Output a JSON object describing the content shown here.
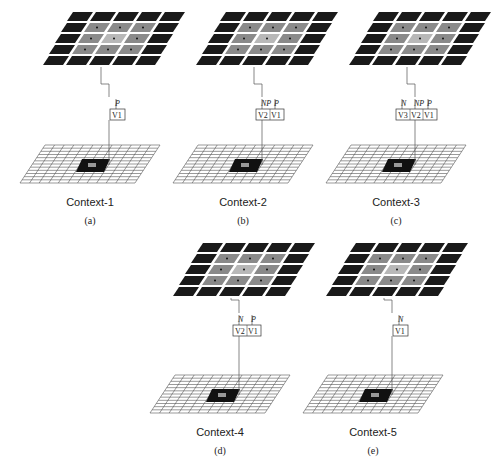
{
  "figure": {
    "panels": [
      {
        "id": "a",
        "context_label": "Context-1",
        "sub_label": "(a)",
        "units": [
          "V1"
        ],
        "unit_inputs": [
          "P"
        ],
        "ox": 55,
        "oy": 12,
        "bx": 20,
        "by": 145
      },
      {
        "id": "b",
        "context_label": "Context-2",
        "sub_label": "(b)",
        "units": [
          "V2",
          "V1"
        ],
        "unit_inputs": [
          "NP",
          "P"
        ],
        "ox": 208,
        "oy": 12,
        "bx": 173,
        "by": 145
      },
      {
        "id": "c",
        "context_label": "Context-3",
        "sub_label": "(c)",
        "units": [
          "V3",
          "V2",
          "V1"
        ],
        "unit_inputs": [
          "N",
          "NP",
          "P"
        ],
        "ox": 361,
        "oy": 12,
        "bx": 326,
        "by": 145
      },
      {
        "id": "d",
        "context_label": "Context-4",
        "sub_label": "(d)",
        "units": [
          "V2",
          "V1"
        ],
        "unit_inputs": [
          "N",
          "P"
        ],
        "ox": 185,
        "oy": 243,
        "bx": 150,
        "by": 375
      },
      {
        "id": "e",
        "context_label": "Context-5",
        "sub_label": "(e)",
        "units": [
          "V1"
        ],
        "unit_inputs": [
          "N"
        ],
        "ox": 338,
        "oy": 243,
        "bx": 303,
        "by": 375
      }
    ],
    "colors": {
      "dark_cell": "#1a1a1a",
      "mid_cell": "#8a8a8a",
      "center_cell": "#b8b8b8",
      "grid_line": "#555555",
      "target": "#111111"
    }
  }
}
